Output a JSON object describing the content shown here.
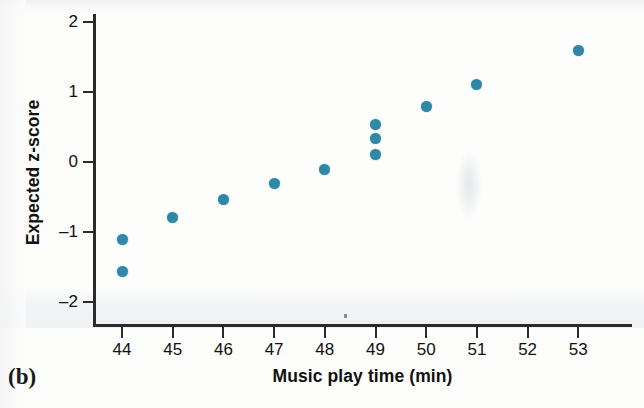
{
  "panel": {
    "label": "(b)"
  },
  "axes": {
    "x": {
      "title": "Music play time (min)",
      "ticks": [
        "44",
        "45",
        "46",
        "47",
        "48",
        "49",
        "50",
        "51",
        "52",
        "53"
      ],
      "values": [
        44,
        45,
        46,
        47,
        48,
        49,
        50,
        51,
        52,
        53
      ],
      "lim": [
        43.4,
        53.6
      ]
    },
    "y": {
      "title": "Expected z-score",
      "ticks": [
        "2",
        "1",
        "0",
        "–1",
        "–2"
      ],
      "values": [
        2,
        1,
        0,
        -1,
        -2
      ],
      "lim": [
        -2.43,
        2.2
      ]
    }
  },
  "colors": {
    "marker": "#2f88a6",
    "axis": "#2b2b2b",
    "text": "#111111",
    "background": "#fdfdfc"
  },
  "chart_data": {
    "type": "scatter",
    "title": "",
    "subtitle": "",
    "xlabel": "Music play time (min)",
    "ylabel": "Expected z-score",
    "xlim": [
      43.4,
      53.6
    ],
    "ylim": [
      -2.43,
      2.2
    ],
    "xticks": [
      44,
      45,
      46,
      47,
      48,
      49,
      50,
      51,
      52,
      53
    ],
    "yticks": [
      2,
      1,
      0,
      -1,
      -2
    ],
    "grid": false,
    "legend": null,
    "annotations": [
      "(b)"
    ],
    "series": [
      {
        "name": "Expected z-score vs music play time",
        "marker": "circle",
        "color": "#2f88a6",
        "points": [
          {
            "x": 44,
            "y": -1.1
          },
          {
            "x": 44,
            "y": -1.57
          },
          {
            "x": 45,
            "y": -0.79
          },
          {
            "x": 46,
            "y": -0.53
          },
          {
            "x": 47,
            "y": -0.31
          },
          {
            "x": 48,
            "y": -0.1
          },
          {
            "x": 49,
            "y": 0.54
          },
          {
            "x": 49,
            "y": 0.33
          },
          {
            "x": 49,
            "y": 0.11
          },
          {
            "x": 50,
            "y": 0.79
          },
          {
            "x": 51,
            "y": 1.11
          },
          {
            "x": 53,
            "y": 1.59
          }
        ]
      }
    ]
  }
}
